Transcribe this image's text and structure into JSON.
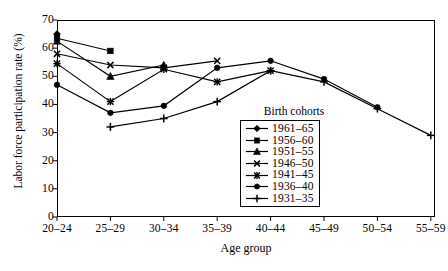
{
  "chart_data": {
    "type": "line",
    "title": "",
    "xlabel": "Age group",
    "ylabel": "Labor force participation rate (%)",
    "categories": [
      "20–24",
      "25–29",
      "30–34",
      "35–39",
      "40–44",
      "45–49",
      "50–54",
      "55–59"
    ],
    "ylim": [
      0,
      70
    ],
    "yticks": [
      0,
      10,
      20,
      30,
      40,
      50,
      60,
      70
    ],
    "grid": false,
    "legend_title": "Birth cohorts",
    "legend_position": "inside-center-right",
    "series": [
      {
        "name": "1961–65",
        "marker": "diamond",
        "x": [
          "20–24"
        ],
        "values": [
          65.0
        ]
      },
      {
        "name": "1956–60",
        "marker": "square",
        "x": [
          "20–24",
          "25–29"
        ],
        "values": [
          63.5,
          59.0
        ]
      },
      {
        "name": "1951–55",
        "marker": "triangle",
        "x": [
          "20–24",
          "25–29",
          "30–34"
        ],
        "values": [
          62.5,
          50.0,
          54.0
        ]
      },
      {
        "name": "1946–50",
        "marker": "cross-x",
        "x": [
          "20–24",
          "25–29",
          "30–34",
          "35–39"
        ],
        "values": [
          58.0,
          54.0,
          53.0,
          55.5
        ]
      },
      {
        "name": "1941–45",
        "marker": "star",
        "x": [
          "20–24",
          "25–29",
          "30–34",
          "35–39",
          "40–44"
        ],
        "values": [
          54.5,
          41.0,
          52.5,
          48.0,
          52.0
        ]
      },
      {
        "name": "1936–40",
        "marker": "circle",
        "x": [
          "20–24",
          "25–29",
          "30–34",
          "35–39",
          "40–44",
          "45–49",
          "50–54"
        ],
        "values": [
          47.0,
          37.0,
          39.5,
          53.0,
          55.5,
          49.0,
          39.0
        ]
      },
      {
        "name": "1931–35",
        "marker": "plus",
        "x": [
          "25–29",
          "30–34",
          "35–39",
          "40–44",
          "45–49",
          "50–54",
          "55–59"
        ],
        "values": [
          32.0,
          35.0,
          41.0,
          52.0,
          48.0,
          38.5,
          29.0
        ]
      }
    ]
  },
  "colors": {
    "ink": "#000000",
    "background": "#ffffff"
  }
}
